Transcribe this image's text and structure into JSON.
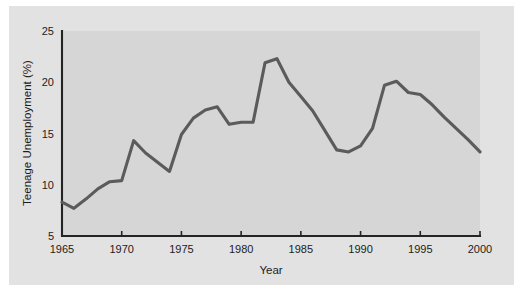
{
  "figure": {
    "background_color": "#e2e2e2",
    "plot_background_color": "#d6d6d6",
    "line_color": "#5b5b5b",
    "axis_color": "#242424"
  },
  "chart_data": {
    "type": "line",
    "title": "",
    "xlabel": "Year",
    "ylabel": "Teenage Unemployment (%)",
    "xlim": [
      1965,
      2000
    ],
    "ylim": [
      5,
      25
    ],
    "xticks": [
      1965,
      1970,
      1975,
      1980,
      1985,
      1990,
      1995,
      2000
    ],
    "xtick_labels": [
      "1965",
      "1970",
      "1975",
      "1980",
      "1985",
      "1990",
      "1995",
      "2000"
    ],
    "yticks": [
      5,
      10,
      15,
      20,
      25
    ],
    "ytick_labels": [
      "5",
      "10",
      "15",
      "20",
      "25"
    ],
    "grid": false,
    "legend": null,
    "series": [
      {
        "name": "Teenage Unemployment",
        "x": [
          1965,
          1966,
          1967,
          1968,
          1969,
          1970,
          1971,
          1972,
          1973,
          1974,
          1975,
          1976,
          1977,
          1978,
          1979,
          1980,
          1981,
          1982,
          1983,
          1984,
          1985,
          1986,
          1987,
          1988,
          1989,
          1990,
          1991,
          1992,
          1993,
          1994,
          1995,
          1996,
          1997,
          1998,
          1999,
          2000
        ],
        "values": [
          8.3,
          7.7,
          8.6,
          9.6,
          10.3,
          10.4,
          14.3,
          13.1,
          12.2,
          11.3,
          14.9,
          16.5,
          17.3,
          17.6,
          15.9,
          16.1,
          16.1,
          21.9,
          22.3,
          20.0,
          18.6,
          17.2,
          15.3,
          13.4,
          13.2,
          13.8,
          15.5,
          19.7,
          20.1,
          19.0,
          18.8,
          17.8,
          16.6,
          15.5,
          14.4,
          13.2
        ]
      }
    ]
  }
}
